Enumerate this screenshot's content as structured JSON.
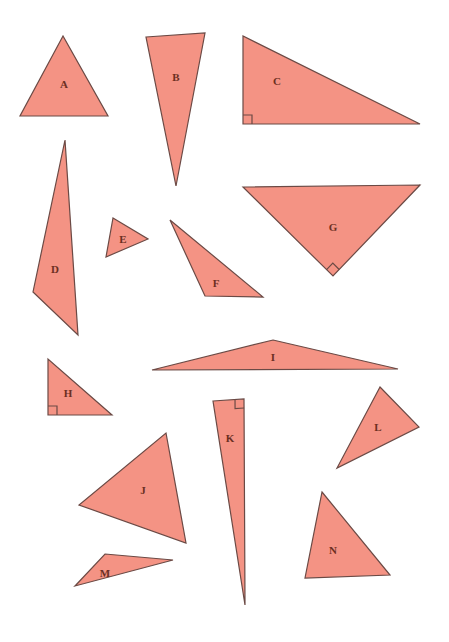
{
  "page": {
    "width": 449,
    "height": 642,
    "background_color": "#FFFFFF"
  },
  "style": {
    "fill_color": "#F49384",
    "stroke_color": "#6B4A45",
    "stroke_width": 1.2,
    "label_color": "#6B2F22",
    "right_angle_marker_size": 9
  },
  "figure": {
    "type": "geometry-diagram",
    "shape_kind": "triangle",
    "count": 14,
    "shapes": [
      {
        "label": "A",
        "points": "63,36 20,116 108,116",
        "label_x": 64,
        "label_y": 85,
        "right_angle": null
      },
      {
        "label": "B",
        "points": "146,37 205,33 176,186",
        "label_x": 176,
        "label_y": 78,
        "right_angle": null
      },
      {
        "label": "C",
        "points": "243,36 243,124 420,124",
        "label_x": 277,
        "label_y": 82,
        "right_angle": {
          "vertex": "243,124",
          "a": "243,36",
          "b": "420,124"
        }
      },
      {
        "label": "D",
        "points": "65,140 33,292 78,335",
        "label_x": 55,
        "label_y": 270,
        "right_angle": null
      },
      {
        "label": "E",
        "points": "113,218 148,239 106,257",
        "label_x": 123,
        "label_y": 240,
        "right_angle": null
      },
      {
        "label": "F",
        "points": "170,220 263,297 205,296",
        "label_x": 216,
        "label_y": 284,
        "right_angle": null
      },
      {
        "label": "G",
        "points": "243,187 420,185 333,276",
        "label_x": 333,
        "label_y": 228,
        "right_angle": {
          "vertex": "333,276",
          "a": "243,187",
          "b": "420,185"
        }
      },
      {
        "label": "H",
        "points": "48,359 48,415 112,415",
        "label_x": 68,
        "label_y": 394,
        "right_angle": {
          "vertex": "48,415",
          "a": "48,359",
          "b": "112,415"
        }
      },
      {
        "label": "I",
        "points": "273,340 398,369 152,370",
        "label_x": 273,
        "label_y": 358,
        "right_angle": null
      },
      {
        "label": "J",
        "points": "166,433 186,543 79,505",
        "label_x": 143,
        "label_y": 491,
        "right_angle": null
      },
      {
        "label": "K",
        "points": "213,401 244,399 245,605",
        "label_x": 230,
        "label_y": 439,
        "right_angle": {
          "vertex": "244,399",
          "a": "213,401",
          "b": "245,605"
        }
      },
      {
        "label": "L",
        "points": "380,387 419,427 337,468",
        "label_x": 378,
        "label_y": 428,
        "right_angle": null
      },
      {
        "label": "M",
        "points": "105,554 173,560 75,586",
        "label_x": 105,
        "label_y": 574,
        "right_angle": null
      },
      {
        "label": "N",
        "points": "322,492 390,575 305,578",
        "label_x": 333,
        "label_y": 551,
        "right_angle": null
      }
    ]
  }
}
